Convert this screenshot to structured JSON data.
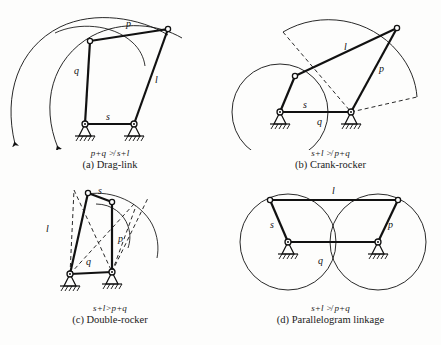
{
  "figure": {
    "link_labels": [
      "s",
      "l",
      "p",
      "q"
    ],
    "stroke_color": "#111111",
    "background_color": "#fdfdfc"
  },
  "panels": [
    {
      "id": "a",
      "key": "drag-link",
      "formula": "p+q ≯ s+l",
      "title": "(a) Drag-link",
      "labels": {
        "p": "p",
        "q": "q",
        "l": "l",
        "s": "s"
      }
    },
    {
      "id": "b",
      "key": "crank-rocker",
      "formula": "s+l ≯ p+q",
      "title": "(b) Crank-rocker",
      "labels": {
        "p": "p",
        "q": "q",
        "l": "l",
        "s": "s"
      }
    },
    {
      "id": "c",
      "key": "double-rocker",
      "formula": "s+l>p+q",
      "title": "(c) Double-rocker",
      "labels": {
        "p": "p",
        "q": "q",
        "l": "l",
        "s": "s"
      }
    },
    {
      "id": "d",
      "key": "parallelogram-linkage",
      "formula": "s+l ≯ p+q",
      "title": "(d) Parallelogram linkage",
      "labels": {
        "p": "p",
        "q": "q",
        "l": "l",
        "s": "s"
      }
    }
  ]
}
